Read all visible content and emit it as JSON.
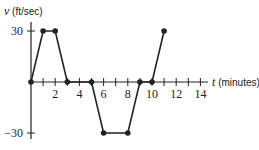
{
  "chart_data": {
    "type": "line",
    "title": "",
    "xlabel": "t (minutes)",
    "ylabel": "v (ft/sec)",
    "xlabel_var": "t",
    "xlabel_unit": "(minutes)",
    "ylabel_var": "v",
    "ylabel_unit": "(ft/sec)",
    "x_ticks": [
      1,
      2,
      3,
      4,
      5,
      6,
      7,
      8,
      9,
      10,
      11,
      12,
      13,
      14
    ],
    "x_tick_labels": [
      "2",
      "4",
      "6",
      "8",
      "10",
      "12",
      "14"
    ],
    "y_tick_labels": [
      "30",
      "−30"
    ],
    "y_ticks": [
      30,
      -30
    ],
    "xlim": [
      0,
      15
    ],
    "ylim": [
      -33,
      36
    ],
    "grid": false,
    "series": [
      {
        "name": "v(t)",
        "x": [
          0,
          1,
          2,
          3,
          5,
          6,
          8,
          9,
          10,
          11
        ],
        "y": [
          0,
          30,
          30,
          0,
          0,
          -30,
          -30,
          0,
          0,
          30
        ]
      }
    ]
  }
}
